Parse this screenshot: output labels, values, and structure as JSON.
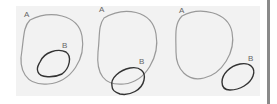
{
  "diagram": {
    "panels": [
      {
        "name": "subset",
        "set_a_label": "A",
        "set_b_label": "B"
      },
      {
        "name": "overlap",
        "set_a_label": "A",
        "set_b_label": "B"
      },
      {
        "name": "disjoint",
        "set_a_label": "A",
        "set_b_label": "B"
      }
    ],
    "colors": {
      "set_a": "#9a9a9a",
      "set_b": "#333333",
      "background": "#f2f2f2"
    }
  }
}
